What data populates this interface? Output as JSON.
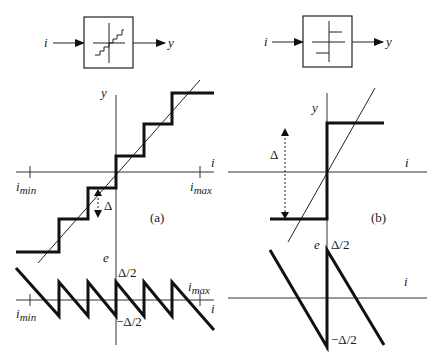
{
  "diagram": {
    "panel_a": {
      "caption": "(a)",
      "block": {
        "input_label": "i",
        "output_label": "y",
        "icon": "staircase-quantizer-icon"
      },
      "top_plot": {
        "y_axis_label": "y",
        "x_axis_label": "i",
        "x_min_label": "i",
        "x_min_sub": "min",
        "x_max_label": "i",
        "x_max_sub": "max",
        "step_label": "Δ"
      },
      "bottom_plot": {
        "y_axis_label": "e",
        "x_axis_label": "i",
        "x_min_label": "i",
        "x_min_sub": "min",
        "x_max_label": "i",
        "x_max_sub": "max",
        "upper_label": "Δ/2",
        "lower_label": "−Δ/2"
      }
    },
    "panel_b": {
      "caption": "(b)",
      "block": {
        "input_label": "i",
        "output_label": "y",
        "icon": "relay-quantizer-icon"
      },
      "top_plot": {
        "y_axis_label": "y",
        "x_axis_label": "i",
        "step_label": "Δ"
      },
      "bottom_plot": {
        "y_axis_label": "e",
        "x_axis_label": "i",
        "upper_label": "Δ/2",
        "lower_label": "−Δ/2"
      }
    }
  }
}
